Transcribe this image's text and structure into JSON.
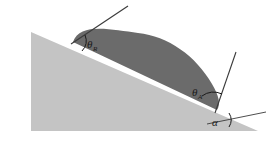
{
  "figure": {
    "background_color": "#ffffff",
    "width": 272,
    "height": 143
  },
  "colors": {
    "substrate_fill": "#c4c4c4",
    "droplet_fill": "#6b6b6b",
    "line_stroke": "#3a3a3a",
    "label_color": "#1a1a1a",
    "background": "#ffffff"
  },
  "shapes": {
    "substrate": {
      "name": "inclined-plane-wedge",
      "points": "31,32 258,131 31,131",
      "fill": "#c4c4c4"
    },
    "droplet": {
      "name": "sessile-droplet",
      "fill": "#6b6b6b",
      "path": "M 73,42 C 80,22 112,30 138,33 C 168,36 196,56 212,84 C 219,96 221,104 217,110 Z"
    }
  },
  "lines": {
    "receding_tangent": {
      "name": "receding-tangent-line",
      "x1": 71,
      "y1": 44,
      "x2": 128,
      "y2": 6
    },
    "advancing_tangent": {
      "name": "advancing-tangent-line",
      "x1": 215,
      "y1": 113,
      "x2": 236,
      "y2": 52
    },
    "horizontal_baseline": {
      "name": "horizontal-reference-line",
      "x1": 207,
      "y1": 124,
      "x2": 266,
      "y2": 112
    }
  },
  "arcs": {
    "theta_r_arc": {
      "name": "receding-angle-arc",
      "path": "M 85,35 A 15,15 0 0 1 82,51"
    },
    "theta_a_arc": {
      "name": "advancing-angle-arc",
      "path": "M 202,96 A 19,19 0 0 1 222,94"
    },
    "alpha_arc": {
      "name": "inclination-angle-arc",
      "path": "M 229,113 A 13,13 0 0 1 229,127"
    }
  },
  "labels": {
    "theta_receding": {
      "name": "theta-receding-label",
      "symbol": "θ",
      "subscript": "R",
      "x": 87,
      "y": 48
    },
    "theta_advancing": {
      "name": "theta-advancing-label",
      "symbol": "θ",
      "subscript": "A",
      "x": 192,
      "y": 96
    },
    "alpha": {
      "name": "alpha-label",
      "symbol": "α",
      "subscript": "",
      "x": 212,
      "y": 126
    }
  }
}
